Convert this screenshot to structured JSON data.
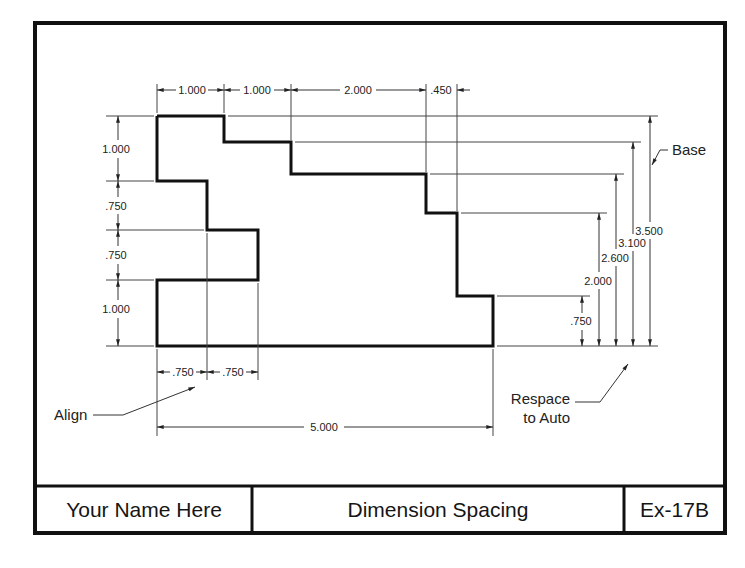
{
  "drawing": {
    "colors": {
      "frame": "#111111",
      "object": "#111111",
      "dim": "#333333",
      "background": "#ffffff"
    },
    "horizontal_dims_top": [
      "1.000",
      "1.000",
      "2.000",
      ".450"
    ],
    "vertical_dims_left": [
      "1.000",
      ".750",
      ".750",
      "1.000"
    ],
    "horizontal_dims_bottom": [
      ".750",
      ".750"
    ],
    "overall_width": "5.000",
    "baseline_dims_right": [
      ".750",
      "2.000",
      "2.600",
      "3.100",
      "3.500"
    ],
    "notes": {
      "base": "Base",
      "align": "Align",
      "respace_line1": "Respace",
      "respace_line2": "to Auto"
    }
  },
  "title_block": {
    "name": "Your Name Here",
    "title": "Dimension Spacing",
    "exercise": "Ex-17B"
  }
}
